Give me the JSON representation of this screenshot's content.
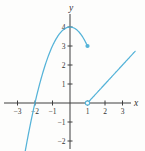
{
  "chart_data": {
    "type": "line",
    "title": "",
    "xlabel": "x",
    "ylabel": "y",
    "xlim": [
      -3.8,
      4.3
    ],
    "ylim": [
      -2.6,
      4.7
    ],
    "grid": false,
    "legend": "none",
    "x_tick_values": [
      -3,
      -2,
      -1,
      1,
      2,
      3
    ],
    "x_tick_labels": [
      "−3",
      "−2",
      "−1",
      "1",
      "2",
      "3"
    ],
    "y_tick_values": [
      -2,
      -1,
      1,
      2,
      3,
      4
    ],
    "y_tick_labels": [
      "−2",
      "−1",
      "1",
      "2",
      "3",
      "4"
    ],
    "series": [
      {
        "name": "parabolic-branch",
        "formula": "y = 4 − x² for x ≤ 1",
        "quadratic": {
          "a": -1,
          "b": 0,
          "c": 4
        },
        "x_start": -2.575,
        "x_end": 1,
        "endpoint": {
          "x": 1,
          "y": 3,
          "style": "closed"
        },
        "key_points": [
          [
            -2.5,
            -2.25
          ],
          [
            -2,
            0
          ],
          [
            -1,
            3
          ],
          [
            0,
            4
          ],
          [
            1,
            3
          ]
        ]
      },
      {
        "name": "linear-branch",
        "formula": "y = x − 1 for x > 1",
        "linear": {
          "m": 1,
          "b": -1
        },
        "x_start": 1,
        "x_end": 3.72,
        "endpoint": {
          "x": 1,
          "y": 0,
          "style": "open"
        },
        "key_points": [
          [
            1,
            0
          ],
          [
            2,
            1
          ],
          [
            3,
            2
          ],
          [
            3.72,
            2.72
          ]
        ]
      }
    ],
    "colors": {
      "curve": "#55b3d8",
      "axis": "#3e3e3e",
      "tick_label": "#333333",
      "background": "#fdfdfc"
    }
  }
}
